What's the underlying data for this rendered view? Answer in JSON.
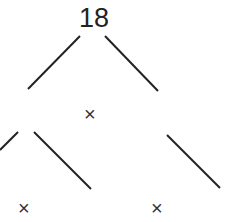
{
  "tree": {
    "root": "18",
    "markers": {
      "middle": "×",
      "bottom_left": "×",
      "bottom_right": "×"
    }
  }
}
